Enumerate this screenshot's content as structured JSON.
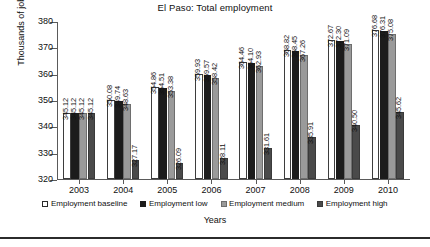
{
  "chart_data": {
    "type": "bar",
    "title": "El Paso: Total employment",
    "xlabel": "Years",
    "ylabel": "Thousands of jobs",
    "ylim": [
      320,
      380
    ],
    "yticks": [
      320,
      330,
      340,
      350,
      360,
      370,
      380
    ],
    "grid": false,
    "legend_position": "bottom",
    "categories": [
      "2003",
      "2004",
      "2005",
      "2006",
      "2007",
      "2008",
      "2009",
      "2010"
    ],
    "series": [
      {
        "name": "Employment baseline",
        "color": "#ffffff",
        "values": [
          345.12,
          350.08,
          354.86,
          359.93,
          364.46,
          368.82,
          372.67,
          376.68
        ]
      },
      {
        "name": "Employment low",
        "color": "#1c1c1c",
        "values": [
          345.12,
          349.74,
          354.51,
          359.57,
          364.1,
          368.45,
          372.3,
          376.31
        ]
      },
      {
        "name": "Employment medium",
        "color": "#9a9a9a",
        "values": [
          345.12,
          348.63,
          353.38,
          358.42,
          362.93,
          367.26,
          371.09,
          375.08
        ]
      },
      {
        "name": "Employment high",
        "color": "#4a4a4a",
        "values": [
          345.12,
          327.17,
          326.09,
          328.11,
          331.61,
          335.91,
          340.5,
          345.62
        ]
      }
    ]
  }
}
